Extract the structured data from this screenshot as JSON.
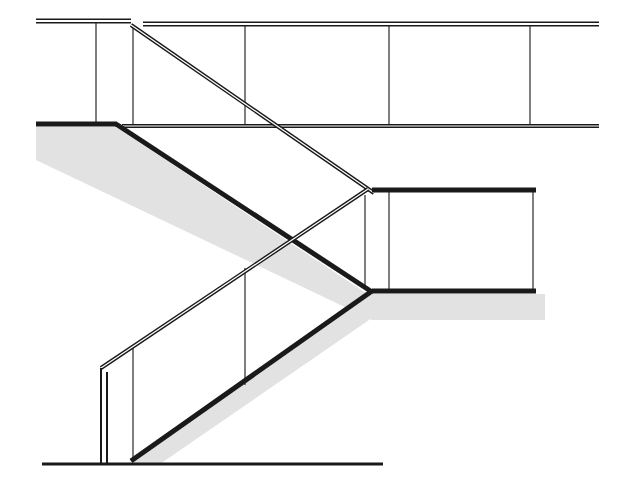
{
  "document": {
    "title": "Staircase Section Drawing",
    "type": "architectural-line-drawing",
    "subject": "switchback stair elevation / section",
    "canvas": {
      "width": 623,
      "height": 493
    },
    "background_color": "#ffffff",
    "line_color": "#1a1a1a",
    "thin_line_color": "#3a3a3a",
    "shadow_color": "#e2e2e2"
  },
  "geometry": {
    "upper_guard_rail_left": {
      "label": "Upper level guard rail (left of stair opening)",
      "x1": 36,
      "y1": 21,
      "x2": 131,
      "y2": 21,
      "thickness": 5
    },
    "upper_guard_rail_right": {
      "label": "Upper level guard rail (right of stair opening)",
      "x1": 143,
      "y1": 24,
      "x2": 599,
      "y2": 24,
      "thickness": 5
    },
    "upper_landing_rail_left": {
      "label": "Upper landing floor edge (left segment)",
      "x1": 36,
      "y1": 124,
      "x2": 117,
      "y2": 124,
      "thickness": 5
    },
    "upper_landing_rail_right": {
      "label": "Upper landing floor edge (right segment)",
      "x1": 122,
      "y1": 126,
      "x2": 599,
      "y2": 126,
      "thickness": 4
    },
    "upper_handrail_diagonal": {
      "label": "Upper flight handrail (descending right)",
      "x1": 131,
      "y1": 25,
      "x2": 374,
      "y2": 193,
      "thickness": 4
    },
    "upper_stringer_diagonal": {
      "label": "Upper flight stringer / stair soffit (descending right)",
      "x1": 116,
      "y1": 124,
      "x2": 372,
      "y2": 292,
      "thickness": 5
    },
    "mid_landing_rail": {
      "label": "Intermediate landing guard rail",
      "x1": 372,
      "y1": 190,
      "x2": 536,
      "y2": 190,
      "thickness": 5
    },
    "lower_landing_floor": {
      "label": "Intermediate landing floor edge",
      "x1": 372,
      "y1": 291,
      "x2": 536,
      "y2": 291,
      "thickness": 5
    },
    "lower_handrail_diagonal": {
      "label": "Lower flight handrail (ascending right)",
      "x1": 101,
      "y1": 368,
      "x2": 368,
      "y2": 189,
      "thickness": 4
    },
    "lower_stringer_diagonal": {
      "label": "Lower flight stringer / stair soffit (ascending right)",
      "x1": 131,
      "y1": 461,
      "x2": 372,
      "y2": 291,
      "thickness": 5
    },
    "newel_post_outer": {
      "label": "Lower newel post outer edge",
      "x1": 101,
      "y1": 368,
      "x2": 101,
      "y2": 464,
      "thickness": 2
    },
    "newel_post_inner": {
      "label": "Lower newel post inner edge",
      "x1": 107,
      "y1": 372,
      "x2": 107,
      "y2": 464,
      "thickness": 2
    },
    "ground_floor_line": {
      "label": "Ground floor datum line",
      "x1": 42,
      "y1": 464,
      "x2": 383,
      "y2": 464,
      "thickness": 3
    },
    "balusters": [
      {
        "name": "upper-baluster-1",
        "x1": 96,
        "y1": 22,
        "x2": 96,
        "y2": 124
      },
      {
        "name": "upper-baluster-2",
        "x1": 133,
        "y1": 25,
        "x2": 133,
        "y2": 128
      },
      {
        "name": "upper-baluster-3",
        "x1": 245,
        "y1": 24,
        "x2": 245,
        "y2": 126
      },
      {
        "name": "upper-baluster-4",
        "x1": 389,
        "y1": 24,
        "x2": 389,
        "y2": 126
      },
      {
        "name": "upper-baluster-5",
        "x1": 530,
        "y1": 24,
        "x2": 530,
        "y2": 126
      },
      {
        "name": "mid-baluster-1",
        "x1": 389,
        "y1": 190,
        "x2": 389,
        "y2": 291
      },
      {
        "name": "mid-baluster-2",
        "x1": 533,
        "y1": 190,
        "x2": 533,
        "y2": 291
      },
      {
        "name": "lower-baluster-1",
        "x1": 133,
        "y1": 345,
        "x2": 133,
        "y2": 461
      },
      {
        "name": "lower-baluster-2",
        "x1": 245,
        "y1": 268,
        "x2": 245,
        "y2": 385
      },
      {
        "name": "stair-post-right",
        "x1": 365,
        "y1": 195,
        "x2": 365,
        "y2": 288
      }
    ],
    "shadows": [
      {
        "name": "upper-flight-shadow",
        "points": "36,127 116,127 372,297 372,320 36,160"
      },
      {
        "name": "lower-landing-shadow",
        "points": "372,294 545,294 545,320 372,320"
      },
      {
        "name": "lower-flight-shadow",
        "points": "131,464 372,294 372,318 160,464"
      }
    ]
  },
  "legend": {
    "elements": [
      "upper guard rail",
      "upper landing edge",
      "upper flight handrail",
      "upper flight stringer",
      "intermediate landing rail",
      "intermediate landing floor",
      "lower flight handrail",
      "lower flight stringer",
      "newel post",
      "ground floor line"
    ]
  }
}
